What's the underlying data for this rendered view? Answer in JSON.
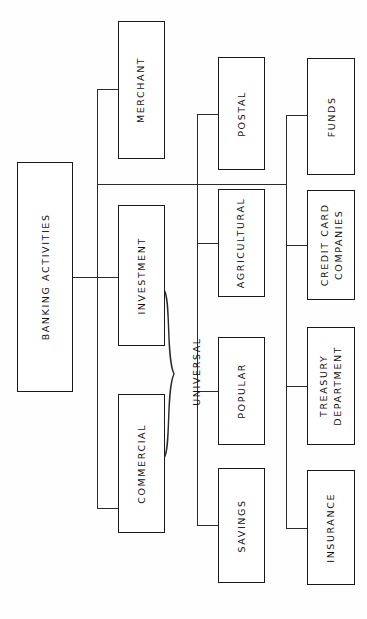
{
  "diagram": {
    "orientation": "rotated-90",
    "root": {
      "label": "BANKING ACTIVITIES"
    },
    "level2": [
      {
        "label": "MERCHANT"
      },
      {
        "label": "INVESTMENT"
      },
      {
        "label": "COMMERCIAL"
      }
    ],
    "level3": [
      {
        "label": "POSTAL"
      },
      {
        "label": "AGRICULTURAL"
      },
      {
        "label": "POPULAR"
      },
      {
        "label": "SAVINGS"
      }
    ],
    "level4": [
      {
        "label": "FUNDS"
      },
      {
        "label": "CREDIT CARD\nCOMPANIES"
      },
      {
        "label": "TREASURY\nDEPARTMENT"
      },
      {
        "label": "INSURANCE"
      }
    ],
    "annotations": [
      {
        "label": "UNIVERSAL",
        "type": "brace-group",
        "covers": [
          "INVESTMENT",
          "COMMERCIAL"
        ]
      }
    ],
    "colors": {
      "background": "#fefefe",
      "box_border": "#1a1a1a",
      "edge": "#2b2b2b",
      "text": "#111111"
    }
  }
}
